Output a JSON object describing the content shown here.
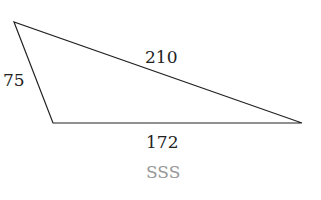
{
  "diagram": {
    "shape": "triangle",
    "sides": {
      "left": "75",
      "top": "210",
      "bottom": "172"
    },
    "caption": "SSS",
    "colors": {
      "stroke": "#222222",
      "caption": "#999999"
    }
  }
}
